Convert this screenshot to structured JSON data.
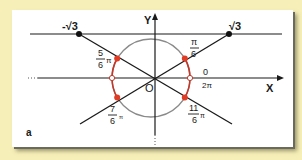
{
  "figure": {
    "panel_label": "a",
    "colors": {
      "background": "#f7efb8",
      "frame": "#ffffff",
      "line": "#1a1a1a",
      "circle": "#8a8a8a",
      "arc_highlight": "#c0392b",
      "point": "#e03b24"
    },
    "axes": {
      "x_label": "X",
      "y_label": "Y",
      "origin_label": "O"
    },
    "tangent_line": {
      "left_point_label": "-√3",
      "right_point_label": "√3"
    },
    "angles": [
      {
        "id": "pi-6",
        "numerator": "π",
        "denominator": "6",
        "suffix": ""
      },
      {
        "id": "5pi-6",
        "numerator": "5",
        "denominator": "6",
        "suffix": "π"
      },
      {
        "id": "7pi-6",
        "numerator": "7",
        "denominator": "6",
        "suffix": "π"
      },
      {
        "id": "11pi-6",
        "numerator": "11",
        "denominator": "6",
        "suffix": "π"
      }
    ],
    "zero_label": "0",
    "two_pi_label": "2π"
  }
}
